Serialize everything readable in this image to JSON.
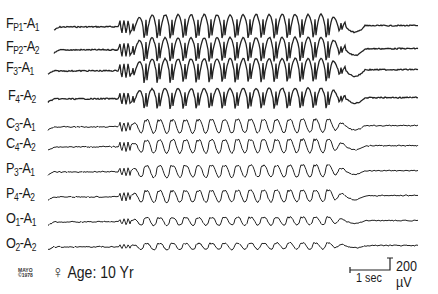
{
  "chart_data": {
    "type": "line",
    "subject": {
      "sex_symbol": "♀",
      "age_label": "Age: 10 Yr"
    },
    "xlabel": "",
    "ylabel": "",
    "grid": false,
    "scale_bar": {
      "time": "1 sec",
      "amplitude": "200 µV",
      "px_per_sec": 40,
      "px_per_200uv": 12
    },
    "discharge": {
      "start_x": 125,
      "end_x": 345,
      "frequency_hz": 3,
      "cycle_px": 13
    },
    "channels": [
      {
        "name": "Fp1-A1",
        "label_main": "F",
        "sub1": "P1",
        "mid": "-A",
        "sub2": "1",
        "baseline_y": 27,
        "amp": 26,
        "style": "spike"
      },
      {
        "name": "Fp2-A2",
        "label_main": "F",
        "sub1": "P2",
        "mid": "-A",
        "sub2": "2",
        "baseline_y": 50,
        "amp": 26,
        "style": "spike"
      },
      {
        "name": "F3-A1",
        "label_main": "F",
        "sub1": "3",
        "mid": "-A",
        "sub2": "1",
        "baseline_y": 71,
        "amp": 26,
        "style": "spike"
      },
      {
        "name": "F4-A2",
        "label_main": "F",
        "sub1": "4",
        "mid": "-A",
        "sub2": "2",
        "baseline_y": 99,
        "amp": 22,
        "style": "spike"
      },
      {
        "name": "C3-A1",
        "label_main": "C",
        "sub1": "3",
        "mid": "-A",
        "sub2": "1",
        "baseline_y": 127,
        "amp": 17,
        "style": "wave"
      },
      {
        "name": "C4-A2",
        "label_main": "C",
        "sub1": "4",
        "mid": "-A",
        "sub2": "2",
        "baseline_y": 147,
        "amp": 17,
        "style": "wave"
      },
      {
        "name": "P3-A1",
        "label_main": "P",
        "sub1": "3",
        "mid": "-A",
        "sub2": "1",
        "baseline_y": 172,
        "amp": 15,
        "style": "wave"
      },
      {
        "name": "P4-A2",
        "label_main": "P",
        "sub1": "4",
        "mid": "-A",
        "sub2": "2",
        "baseline_y": 197,
        "amp": 15,
        "style": "wave"
      },
      {
        "name": "O1-A1",
        "label_main": "O",
        "sub1": "1",
        "mid": "-A",
        "sub2": "1",
        "baseline_y": 222,
        "amp": 10,
        "style": "wave"
      },
      {
        "name": "O2-A2",
        "label_main": "O",
        "sub1": "2",
        "mid": "-A",
        "sub2": "2",
        "baseline_y": 247,
        "amp": 8,
        "style": "wave"
      }
    ]
  },
  "footer": {
    "logo_line1": "MAYO",
    "logo_line2": "©1978",
    "sex_symbol": "♀",
    "age": "Age: 10 Yr",
    "time_scale": "1 sec",
    "amp_scale": "200 µV"
  }
}
